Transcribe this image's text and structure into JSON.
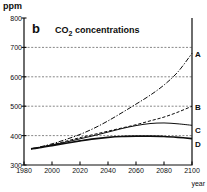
{
  "figure": {
    "panel_letter": "b",
    "title_main": "CO",
    "title_sub": "2",
    "title_rest": " concentrations",
    "yaxis_unit": "ppm",
    "xaxis_label": "year"
  },
  "axes": {
    "y_ticks": [
      "800",
      "700",
      "600",
      "500",
      "400",
      "300"
    ],
    "x_ticks": [
      "1980",
      "2000",
      "2020",
      "2040",
      "2060",
      "2080",
      "2100"
    ]
  },
  "curve_labels": {
    "a": "A",
    "b": "B",
    "c": "C",
    "d": "D"
  },
  "colors": {
    "ink": "#0d0d0d",
    "grid": "#555555",
    "background": "#ffffff"
  },
  "chart_data": {
    "type": "line",
    "title": "CO2 concentrations",
    "panel": "b",
    "xlabel": "year",
    "ylabel": "ppm",
    "xlim": [
      1980,
      2100
    ],
    "ylim": [
      300,
      800
    ],
    "x_ticks": [
      1980,
      2000,
      2020,
      2040,
      2060,
      2080,
      2100
    ],
    "y_ticks": [
      300,
      400,
      500,
      600,
      700,
      800
    ],
    "grid": "horizontal-dotted",
    "legend": "right-edge-labels",
    "x": [
      1985,
      1990,
      2000,
      2010,
      2020,
      2030,
      2040,
      2050,
      2060,
      2070,
      2080,
      2090,
      2100
    ],
    "series": [
      {
        "name": "A",
        "label": "A",
        "linestyle": "dash-dot",
        "values": [
          355,
          360,
          372,
          387,
          404,
          425,
          450,
          478,
          507,
          537,
          572,
          617,
          680
        ]
      },
      {
        "name": "B",
        "label": "B",
        "linestyle": "dashed",
        "values": [
          355,
          359,
          369,
          381,
          393,
          404,
          415,
          426,
          437,
          450,
          463,
          480,
          500
        ]
      },
      {
        "name": "C",
        "label": "C",
        "linestyle": "solid",
        "values": [
          355,
          359,
          368,
          378,
          389,
          400,
          412,
          424,
          434,
          441,
          443,
          440,
          435
        ]
      },
      {
        "name": "D",
        "label": "D",
        "linestyle": "solid-thick",
        "values": [
          355,
          358,
          366,
          374,
          382,
          389,
          394,
          397,
          398,
          398,
          397,
          394,
          390
        ]
      }
    ]
  }
}
